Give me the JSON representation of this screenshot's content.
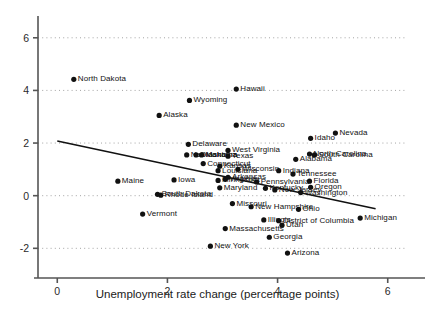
{
  "chart_data": {
    "type": "scatter",
    "title": "",
    "xlabel": "Unemployment rate change (percentage points)",
    "ylabel": "",
    "xlim": [
      -0.35,
      6.35
    ],
    "ylim": [
      -2.9,
      6.6
    ],
    "xticks": [
      0,
      2,
      4,
      6
    ],
    "yticks": [
      -2,
      0,
      2,
      4,
      6
    ],
    "xticklabels": [
      "0",
      "2",
      "4",
      "6"
    ],
    "yticklabels": [
      "-2",
      "0",
      "2",
      "4",
      "6"
    ],
    "grid": "horizontal-dotted",
    "legend": "none",
    "marker_color": "#111111",
    "line_color": "#111111",
    "trendline": {
      "label": "fitted regression line",
      "x0": 0.0,
      "y0": 2.08,
      "x1": 5.78,
      "y1": -0.5
    },
    "points": [
      {
        "label": "North Dakota",
        "x": 0.3,
        "y": 4.42
      },
      {
        "label": "Wyoming",
        "x": 2.4,
        "y": 3.62
      },
      {
        "label": "Hawaii",
        "x": 3.25,
        "y": 4.05
      },
      {
        "label": "Alaska",
        "x": 1.85,
        "y": 3.05
      },
      {
        "label": "New Mexico",
        "x": 3.25,
        "y": 2.68
      },
      {
        "label": "Nevada",
        "x": 5.05,
        "y": 2.38
      },
      {
        "label": "Idaho",
        "x": 4.6,
        "y": 2.18
      },
      {
        "label": "Delaware",
        "x": 2.38,
        "y": 1.95
      },
      {
        "label": "West Virginia",
        "x": 3.1,
        "y": 1.72
      },
      {
        "label": "North Carolina",
        "x": 4.58,
        "y": 1.58
      },
      {
        "label": "South Carolina",
        "x": 4.67,
        "y": 1.55
      },
      {
        "label": "Nebraska",
        "x": 2.35,
        "y": 1.55
      },
      {
        "label": "Oklahoma",
        "x": 2.52,
        "y": 1.55
      },
      {
        "label": "Montana",
        "x": 2.62,
        "y": 1.55
      },
      {
        "label": "Texas",
        "x": 3.1,
        "y": 1.5
      },
      {
        "label": "Alabama",
        "x": 4.33,
        "y": 1.38
      },
      {
        "label": "Connecticut",
        "x": 2.65,
        "y": 1.22
      },
      {
        "label": "Kansas",
        "x": 2.95,
        "y": 1.12
      },
      {
        "label": "Wisconsin",
        "x": 3.28,
        "y": 1.0
      },
      {
        "label": "Louisiana",
        "x": 2.92,
        "y": 0.95
      },
      {
        "label": "Indiana",
        "x": 4.02,
        "y": 0.95
      },
      {
        "label": "Tennessee",
        "x": 4.28,
        "y": 0.82
      },
      {
        "label": "Iowa",
        "x": 2.12,
        "y": 0.6
      },
      {
        "label": "Minnesota",
        "x": 2.92,
        "y": 0.58
      },
      {
        "label": "Virginia",
        "x": 3.05,
        "y": 0.62
      },
      {
        "label": "Arkansas",
        "x": 3.1,
        "y": 0.7
      },
      {
        "label": "Maine",
        "x": 1.1,
        "y": 0.55
      },
      {
        "label": "Florida",
        "x": 4.58,
        "y": 0.55
      },
      {
        "label": "Oregon",
        "x": 4.6,
        "y": 0.32
      },
      {
        "label": "Pennsylvania",
        "x": 3.62,
        "y": 0.52
      },
      {
        "label": "Maryland",
        "x": 2.95,
        "y": 0.3
      },
      {
        "label": "Kentucky",
        "x": 3.78,
        "y": 0.28
      },
      {
        "label": "New Jersey",
        "x": 3.95,
        "y": 0.22
      },
      {
        "label": "Washington",
        "x": 4.42,
        "y": 0.12
      },
      {
        "label": "South Dakota",
        "x": 1.82,
        "y": 0.05
      },
      {
        "label": "Rhode Island",
        "x": 1.88,
        "y": 0.02
      },
      {
        "label": "Missouri",
        "x": 3.18,
        "y": -0.3
      },
      {
        "label": "New Hampshire",
        "x": 3.52,
        "y": -0.42
      },
      {
        "label": "Ohio",
        "x": 4.38,
        "y": -0.52
      },
      {
        "label": "Vermont",
        "x": 1.55,
        "y": -0.7
      },
      {
        "label": "Michigan",
        "x": 5.5,
        "y": -0.85
      },
      {
        "label": "Illinois",
        "x": 3.75,
        "y": -0.92
      },
      {
        "label": "District of Columbia",
        "x": 4.02,
        "y": -0.95
      },
      {
        "label": "Utah",
        "x": 4.08,
        "y": -1.12
      },
      {
        "label": "Massachusetts",
        "x": 3.05,
        "y": -1.25
      },
      {
        "label": "Georgia",
        "x": 3.85,
        "y": -1.58
      },
      {
        "label": "New York",
        "x": 2.78,
        "y": -1.92
      },
      {
        "label": "Arizona",
        "x": 4.18,
        "y": -2.18
      }
    ]
  }
}
